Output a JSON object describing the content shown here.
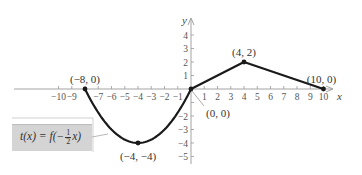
{
  "chart_data": {
    "type": "line",
    "title": "",
    "xlabel": "x",
    "ylabel": "y",
    "xlim": [
      -11,
      11
    ],
    "ylim": [
      -6,
      5
    ],
    "x_ticks": [
      -10,
      -9,
      -8,
      -7,
      -6,
      -5,
      -4,
      -3,
      -2,
      -1,
      1,
      2,
      3,
      4,
      5,
      6,
      7,
      8,
      9,
      10
    ],
    "x_tick_labels": [
      "−10",
      "−9",
      "",
      "−7",
      "−6",
      "−5",
      "−4",
      "−3",
      "−2",
      "−1",
      "1",
      "2",
      "3",
      "4",
      "5",
      "6",
      "7",
      "8",
      "9",
      "10"
    ],
    "y_ticks": [
      4,
      3,
      2,
      1,
      -1,
      -2,
      -3,
      -4,
      -5
    ],
    "y_tick_labels": [
      "4",
      "3",
      "2",
      "1",
      "",
      "−2",
      "−3",
      "−4",
      "−5"
    ],
    "series": [
      {
        "name": "t(x) = f(−½x)",
        "segments": [
          {
            "kind": "parabola",
            "from": [
              -8,
              0
            ],
            "vertex": [
              -4,
              -4
            ],
            "to": [
              0,
              0
            ]
          },
          {
            "kind": "line",
            "points": [
              [
                0,
                0
              ],
              [
                4,
                2
              ],
              [
                10,
                0
              ]
            ]
          }
        ]
      }
    ],
    "points": [
      {
        "x": -8,
        "y": 0,
        "label": "(−8, 0)"
      },
      {
        "x": -4,
        "y": -4,
        "label": "(−4, −4)"
      },
      {
        "x": 0,
        "y": 0,
        "label": "(0, 0)"
      },
      {
        "x": 4,
        "y": 2,
        "label": "(4, 2)"
      },
      {
        "x": 10,
        "y": 0,
        "label": "(10, 0)"
      }
    ],
    "annotation": {
      "function_label": "t(x) = f(−½x)",
      "function_parts": {
        "lhs": "t(x) = f(−",
        "frac_num": "1",
        "frac_den": "2",
        "rhs": "x)"
      }
    },
    "grid": false,
    "colors": {
      "curve": "#1a1a1a",
      "axis": "#999999",
      "box": "#d4d4d4"
    }
  }
}
